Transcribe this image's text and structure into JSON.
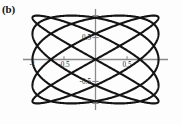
{
  "figure": {
    "panel_label": "(b)",
    "background_color": "#fdfdfd",
    "curve_color": "#141414",
    "axis_color": "#8a8a8a",
    "tick_label_color": "#2a2a2a"
  },
  "chart_data": {
    "type": "line",
    "title": "",
    "subtitle": "",
    "xlabel": "",
    "ylabel": "",
    "grid": false,
    "legend": null,
    "xlim": [
      -1.15,
      1.15
    ],
    "ylim": [
      -1.15,
      1.15
    ],
    "x_ticks": [
      -1,
      -0.5,
      0.5
    ],
    "x_tick_labels": [
      "-1",
      "-0.5",
      "0.5"
    ],
    "y_ticks": [
      1,
      0.5,
      -0.5,
      -1
    ],
    "y_tick_labels": [
      "",
      "0.5",
      "-0.5",
      ""
    ],
    "parametric": {
      "x_expression": "cos(5t)",
      "y_expression": "sin(4t)",
      "freq_x": 5,
      "freq_y": 4,
      "phase": 0,
      "t_range": [
        0,
        6.283185307179586
      ],
      "samples": 1600,
      "amplitude_x": 1,
      "amplitude_y": 1
    },
    "line_width": 2.1
  }
}
